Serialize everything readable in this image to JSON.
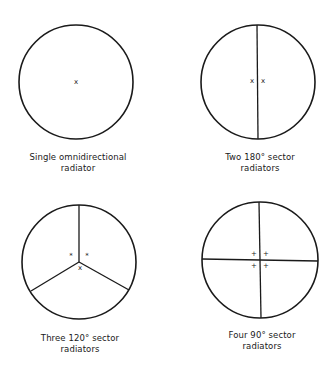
{
  "figure": {
    "panels": [
      {
        "id": "single",
        "caption_line1": "Single omnidirectional",
        "caption_line2": "radiator",
        "sectors": 1,
        "sector_angle": "360°",
        "markers": [
          "x"
        ]
      },
      {
        "id": "two",
        "caption_line1": "Two 180° sector",
        "caption_line2": "radiators",
        "sectors": 2,
        "sector_angle": "180°",
        "markers": [
          "x",
          "x"
        ]
      },
      {
        "id": "three",
        "caption_line1": "Three 120° sector",
        "caption_line2": "radiators",
        "sectors": 3,
        "sector_angle": "120°",
        "markers": [
          "*",
          "*",
          "x"
        ]
      },
      {
        "id": "four",
        "caption_line1": "Four 90° sector",
        "caption_line2": "radiators",
        "sectors": 4,
        "sector_angle": "90°",
        "markers": [
          "+",
          "+",
          "+",
          "+"
        ]
      }
    ]
  }
}
